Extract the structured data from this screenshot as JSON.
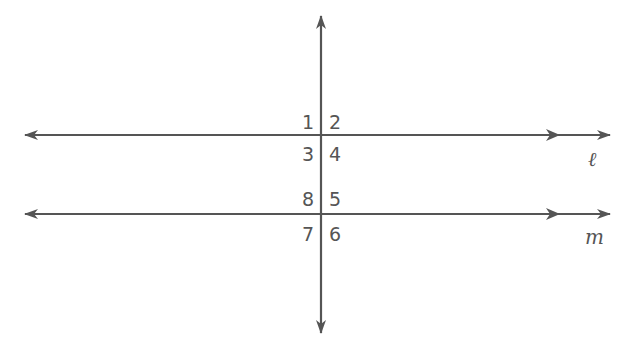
{
  "diagram": {
    "type": "parallel-lines-cut-by-transversal",
    "line_color": "#555555",
    "lines": {
      "l": {
        "label": "ℓ",
        "y": 135
      },
      "m": {
        "label": "m",
        "y": 214
      },
      "transversal": {
        "x": 321
      }
    },
    "angles": [
      {
        "id": "1",
        "label": "1"
      },
      {
        "id": "2",
        "label": "2"
      },
      {
        "id": "3",
        "label": "3"
      },
      {
        "id": "4",
        "label": "4"
      },
      {
        "id": "5",
        "label": "5"
      },
      {
        "id": "6",
        "label": "6"
      },
      {
        "id": "7",
        "label": "7"
      },
      {
        "id": "8",
        "label": "8"
      }
    ],
    "parallel_marks": "single-arrow on each horizontal line"
  }
}
